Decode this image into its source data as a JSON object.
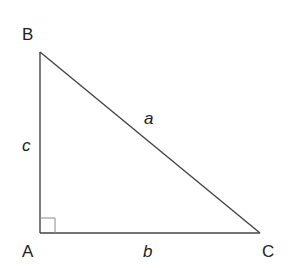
{
  "diagram": {
    "type": "right-triangle",
    "vertices": [
      {
        "id": "A",
        "label": "A",
        "x": 40,
        "y": 233,
        "right_angle": true
      },
      {
        "id": "B",
        "label": "B",
        "x": 40,
        "y": 52
      },
      {
        "id": "C",
        "label": "C",
        "x": 260,
        "y": 233
      }
    ],
    "sides": [
      {
        "id": "a",
        "label": "a",
        "from": "B",
        "to": "C",
        "role": "hypotenuse"
      },
      {
        "id": "b",
        "label": "b",
        "from": "A",
        "to": "C"
      },
      {
        "id": "c",
        "label": "c",
        "from": "A",
        "to": "B"
      }
    ],
    "colors": {
      "stroke": "#333333",
      "right_angle_marker": "#888888",
      "text": "#222222"
    }
  }
}
